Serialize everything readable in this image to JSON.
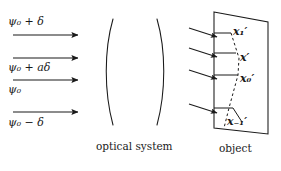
{
  "figure": {
    "background_color": "#ffffff",
    "ink_color": "#1a1a1a"
  },
  "beams": {
    "items": [
      {
        "label": "ψ₀ + δ",
        "psi": "ψ",
        "sub": "0",
        "operator": "+",
        "term": "δ",
        "y_arrow": 35,
        "y_label": 22
      },
      {
        "label": "ψ₀ + aδ",
        "psi": "ψ",
        "sub": "0",
        "operator": "+",
        "term": "aδ",
        "y_arrow": 58,
        "y_label": 68
      },
      {
        "label": "ψ₀",
        "psi": "ψ",
        "sub": "0",
        "operator": "",
        "term": "",
        "y_arrow": 80,
        "y_label": 90
      },
      {
        "label": "ψ₀ − δ",
        "psi": "ψ",
        "sub": "0",
        "operator": "−",
        "term": "δ",
        "y_arrow": 112,
        "y_label": 122
      }
    ]
  },
  "optical_system": {
    "caption": "optical system"
  },
  "object_plane": {
    "caption": "object",
    "points": [
      {
        "name": "x₁′",
        "base": "x",
        "prime": "′",
        "sub": "1"
      },
      {
        "name": "x′",
        "base": "x",
        "prime": "′",
        "sub": ""
      },
      {
        "name": "x₀′",
        "base": "x",
        "prime": "′",
        "sub": "0"
      },
      {
        "name": "x₋₁′",
        "base": "x",
        "prime": "′",
        "sub": "−1"
      }
    ]
  }
}
